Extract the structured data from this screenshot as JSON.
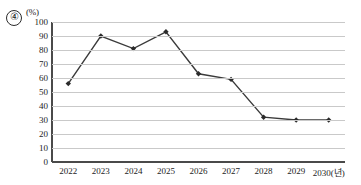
{
  "question_number": "④",
  "unit_label": "(%)",
  "chart_data": {
    "type": "line",
    "title": "",
    "xlabel": "2030(년)",
    "ylabel": "(%)",
    "categories": [
      "2022",
      "2023",
      "2024",
      "2025",
      "2026",
      "2027",
      "2028",
      "2029",
      "2030(년)"
    ],
    "values": [
      56,
      90,
      81,
      93,
      63,
      59,
      32,
      30,
      30
    ],
    "series": [
      {
        "name": "",
        "values": [
          56,
          90,
          81,
          93,
          63,
          59,
          32,
          30,
          30
        ]
      }
    ],
    "ylim": [
      0,
      100
    ],
    "ytick_labels": [
      "0",
      "10",
      "20",
      "30",
      "40",
      "50",
      "60",
      "70",
      "80",
      "90",
      "100"
    ],
    "ytick_values": [
      0,
      10,
      20,
      30,
      40,
      50,
      60,
      70,
      80,
      90,
      100
    ],
    "grid": true,
    "legend": "none",
    "line_color": "#3a3a3a",
    "marker_color": "#2b2b2b",
    "grid_color": "#c9c9c9",
    "axis_color": "#4a4a4a"
  }
}
